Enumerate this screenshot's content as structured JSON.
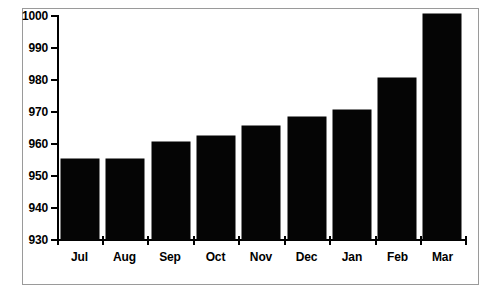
{
  "chart_data": {
    "type": "bar",
    "title": "",
    "subtitle": "",
    "xlabel": "",
    "ylabel": "",
    "categories": [
      "Jul",
      "Aug",
      "Sep",
      "Oct",
      "Nov",
      "Dec",
      "Jan",
      "Feb",
      "Mar"
    ],
    "values": [
      955.3,
      955.3,
      960.5,
      962.3,
      965.5,
      968.4,
      970.5,
      980.5,
      1000.3
    ],
    "series": [
      {
        "name": "",
        "values": [
          955.3,
          955.3,
          960.5,
          962.3,
          965.5,
          968.4,
          970.5,
          980.5,
          1000.3
        ]
      }
    ],
    "ylim": [
      930,
      1000
    ],
    "ytick_labels": [
      "1000",
      "990",
      "980",
      "970",
      "960",
      "950",
      "940",
      "930"
    ],
    "ytick_values": [
      1000,
      990,
      980,
      970,
      960,
      950,
      940,
      930
    ],
    "xtick_labels": [
      "Jul",
      "Aug",
      "Sep",
      "Oct",
      "Nov",
      "Dec",
      "Jan",
      "Feb",
      "Mar"
    ],
    "grid": false,
    "legend": false,
    "legend_position": "none",
    "bar_color": "#050505",
    "axis_color": "#000000",
    "background_color": "#ffffff",
    "frame_color": "#9a9a9a",
    "annotations": []
  }
}
